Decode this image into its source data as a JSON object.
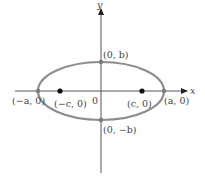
{
  "diagram": {
    "axes": {
      "x_label": "x",
      "y_label": "y",
      "origin_label": "0"
    },
    "ellipse": {
      "color": "#8d8d8d",
      "semi_major": "a",
      "semi_minor": "b"
    },
    "points": {
      "vertex_left": "(−a, 0)",
      "vertex_right": "(a, 0)",
      "covertex_top": "(0, b)",
      "covertex_bottom": "(0, −b)",
      "focus_left": "(−c, 0)",
      "focus_right": "(c, 0)"
    },
    "colors": {
      "axis": "#555555",
      "focus": "#111111",
      "vertex": "#7a7a7a"
    }
  }
}
